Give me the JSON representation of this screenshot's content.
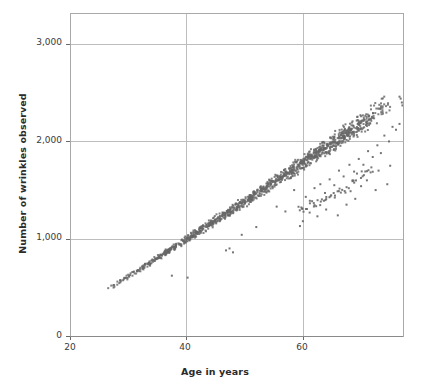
{
  "figure": {
    "title": "",
    "background_color": "#ffffff",
    "frame_color": "#a8a8a8",
    "grid_color": "#bdbdbd",
    "marker_color": "#666666",
    "text_color": "#2b2b2b"
  },
  "axes": {
    "x_title": "Age in years",
    "y_title": "Number of wrinkles observed",
    "x_ticks": [
      "20",
      "40",
      "60"
    ],
    "y_ticks": [
      "0",
      "1,000",
      "2,000",
      "3,000"
    ]
  },
  "chart_data": {
    "type": "scatter",
    "title": "",
    "xlabel": "Age in years",
    "ylabel": "Number of wrinkles observed",
    "xlim": [
      20,
      77.2
    ],
    "ylim": [
      0,
      3320
    ],
    "xticks": [
      20,
      40,
      60
    ],
    "yticks": [
      0,
      1000,
      2000,
      3000
    ],
    "xticklabels": [
      "20",
      "40",
      "60"
    ],
    "yticklabels": [
      "0",
      "1,000",
      "2,000",
      "3,000"
    ],
    "grid": true,
    "grid_axes": "both",
    "legend": null,
    "marker": "square",
    "marker_size": 2,
    "marker_color": "#666666",
    "n_points_approx": 1400,
    "series": [
      {
        "name": "main-band",
        "kind": "dense-band",
        "x_start": 24.0,
        "x_end": 77.0,
        "y_at_x_start": 385,
        "y_at_x_end": 2420,
        "band_halfwidth_at_start": 18,
        "band_halfwidth_at_end": 135,
        "n_points": 1150
      },
      {
        "name": "low-outlier-spray",
        "kind": "scatter",
        "points": [
          [
            37.5,
            620
          ],
          [
            40.2,
            600
          ],
          [
            46.8,
            880
          ],
          [
            47.4,
            900
          ],
          [
            48.0,
            860
          ],
          [
            49.5,
            1040
          ],
          [
            52.0,
            1120
          ],
          [
            55.5,
            1330
          ],
          [
            57.0,
            1280
          ],
          [
            58.5,
            1500
          ],
          [
            59.5,
            1130
          ],
          [
            60.5,
            1430
          ],
          [
            61.2,
            1390
          ],
          [
            62.0,
            1520
          ],
          [
            63.0,
            1560
          ],
          [
            63.8,
            1470
          ],
          [
            64.6,
            1610
          ],
          [
            65.4,
            1550
          ],
          [
            66.2,
            1700
          ],
          [
            67.0,
            1640
          ],
          [
            68.0,
            1760
          ],
          [
            68.8,
            1690
          ],
          [
            69.6,
            1820
          ],
          [
            70.4,
            1760
          ],
          [
            71.2,
            1900
          ],
          [
            72.0,
            1840
          ],
          [
            72.8,
            1960
          ],
          [
            73.4,
            1880
          ],
          [
            74.0,
            2060
          ],
          [
            74.8,
            2000
          ],
          [
            75.4,
            2150
          ],
          [
            76.0,
            2120
          ],
          [
            76.6,
            2180
          ],
          [
            70.0,
            1540
          ],
          [
            71.0,
            1600
          ],
          [
            73.0,
            1700
          ],
          [
            75.0,
            1750
          ],
          [
            66.0,
            1240
          ],
          [
            69.0,
            1410
          ],
          [
            72.5,
            1500
          ],
          [
            74.5,
            1560
          ],
          [
            60.0,
            1180
          ],
          [
            62.5,
            1230
          ],
          [
            64.0,
            1300
          ],
          [
            67.5,
            1350
          ]
        ],
        "n_points": 45
      },
      {
        "name": "lower-arc-cluster",
        "kind": "arc",
        "x_start": 59.0,
        "x_end": 72.0,
        "y_start": 1300,
        "y_peak": 1730,
        "curvature": "concave-up rising tail that separates below the main band",
        "n_points": 55
      },
      {
        "name": "top-right-tip",
        "kind": "scatter",
        "points": [
          [
            76.8,
            2440
          ],
          [
            77.0,
            2400
          ],
          [
            76.6,
            2460
          ],
          [
            77.1,
            2370
          ]
        ],
        "n_points": 4
      }
    ]
  }
}
